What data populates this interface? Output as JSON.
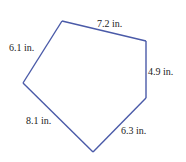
{
  "figure": {
    "shape": "pentagon",
    "units": "in.",
    "line_color": "#4a5aa8",
    "sides": [
      {
        "id": "top",
        "label": "7.2 in.",
        "length": 7.2
      },
      {
        "id": "right",
        "label": "4.9 in.",
        "length": 4.9
      },
      {
        "id": "lower-right",
        "label": "6.3 in.",
        "length": 6.3
      },
      {
        "id": "lower-left",
        "label": "8.1 in.",
        "length": 8.1
      },
      {
        "id": "upper-left",
        "label": "6.1 in.",
        "length": 6.1
      }
    ]
  }
}
